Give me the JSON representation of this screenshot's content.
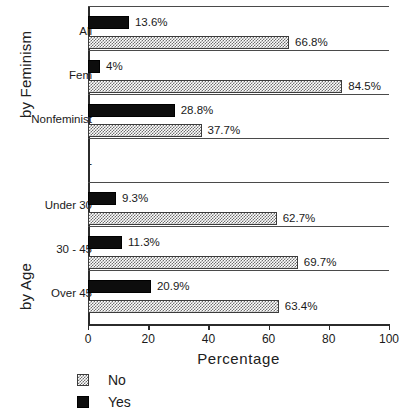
{
  "chart_data": {
    "type": "bar",
    "orientation": "horizontal",
    "title": "",
    "xlabel": "Percentage",
    "ylabel": "",
    "xlim": [
      0,
      100
    ],
    "xticks": [
      0,
      20,
      40,
      60,
      80,
      100
    ],
    "xtick_labels": [
      "0",
      "20",
      "40",
      "60",
      "80",
      "100"
    ],
    "grid": false,
    "legend_position": "below-left",
    "value_suffix": "%",
    "group_axis_titles": [
      "by Feminism",
      "by Age"
    ],
    "categories": [
      "All",
      "Fem",
      "Nonfeminist",
      "-",
      "Under 30",
      "30 - 45",
      "Over 45"
    ],
    "series": [
      {
        "name": "Yes",
        "color": "#0d0d0d",
        "pattern": "solid",
        "values": [
          13.6,
          4,
          28.8,
          null,
          9.3,
          11.3,
          20.9
        ],
        "labels": [
          "13.6%",
          "4%",
          "28.8%",
          "",
          "9.3%",
          "11.3%",
          "20.9%"
        ]
      },
      {
        "name": "No",
        "color": "#6e6e6e",
        "pattern": "checker",
        "values": [
          66.8,
          84.5,
          37.7,
          null,
          62.7,
          69.7,
          63.4
        ],
        "labels": [
          "66.8%",
          "84.5%",
          "37.7%",
          "",
          "62.7%",
          "69.7%",
          "63.4%"
        ]
      }
    ],
    "groups": [
      {
        "title": "by Feminism",
        "categories": [
          "All",
          "Fem",
          "Nonfeminist"
        ]
      },
      {
        "title": "",
        "categories": [
          "-"
        ]
      },
      {
        "title": "by Age",
        "categories": [
          "Under 30",
          "30 - 45",
          "Over 45"
        ]
      }
    ]
  },
  "legend": {
    "entries": [
      {
        "label": "No",
        "swatch": "checker-swatch-icon"
      },
      {
        "label": "Yes",
        "swatch": "solid-swatch-icon"
      }
    ]
  },
  "axis": {
    "x_title": "Percentage"
  }
}
